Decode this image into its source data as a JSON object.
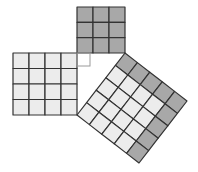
{
  "diagram": {
    "colors": {
      "dark_fill": "#a8a8a8",
      "light_fill": "#ececec",
      "grid_line": "#333333",
      "right_angle_marker": "#9a9a9a",
      "background": "#ffffff"
    },
    "triangle": {
      "right_angle_vertex": [
        77,
        53
      ],
      "leg_a_end": [
        125,
        53
      ],
      "leg_b_end": [
        77,
        115
      ]
    },
    "squares": [
      {
        "id": "square-a",
        "label": "3x3 square on short leg",
        "n": 3,
        "origin": [
          77,
          7
        ],
        "u": [
          48,
          0
        ],
        "v": [
          0,
          46
        ],
        "dark_cells": "all"
      },
      {
        "id": "square-b",
        "label": "4x4 square on long leg",
        "n": 4,
        "origin": [
          13,
          53
        ],
        "u": [
          64,
          0
        ],
        "v": [
          0,
          62
        ],
        "dark_cells": "none"
      },
      {
        "id": "square-c",
        "label": "5x5 square on hypotenuse",
        "n": 5,
        "origin": [
          125,
          53
        ],
        "u": [
          62,
          48
        ],
        "v": [
          -48,
          62
        ],
        "dark_cells": "L",
        "dark_rule": "row v=0 and column u=n-1 are dark (9 dark, 16 light)"
      }
    ],
    "right_angle_marker": {
      "origin": [
        77,
        53
      ],
      "size": 13
    }
  }
}
